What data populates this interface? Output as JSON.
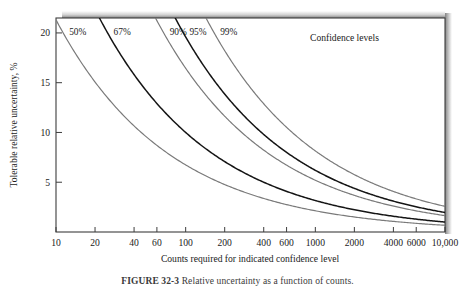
{
  "figure": {
    "caption_number": "FIGURE 32-3",
    "caption_text": "Relative uncertainty as a function of counts."
  },
  "chart_data": {
    "type": "line",
    "title": "",
    "xlabel": "Counts required for indicated confidence level",
    "ylabel": "Tolerable relative uncertainty, %",
    "legend_title": "Confidence levels",
    "legend_position": "top-right-inside",
    "xscale": "log",
    "yscale": "linear",
    "xlim": [
      10,
      10000
    ],
    "ylim": [
      0,
      21.5
    ],
    "grid": false,
    "xticks": [
      10,
      20,
      40,
      60,
      100,
      200,
      400,
      600,
      1000,
      2000,
      4000,
      6000,
      10000
    ],
    "xticklabels": [
      "10",
      "20",
      "40",
      "60",
      "100",
      "200",
      "400",
      "600",
      "1000",
      "2000",
      "4000",
      "6000",
      "10,000"
    ],
    "yticks": [
      5,
      10,
      15,
      20
    ],
    "yticklabels": [
      "5",
      "10",
      "15",
      "20"
    ],
    "relation": "y = k / sqrt(x)",
    "series": [
      {
        "name": "50%",
        "label": "50%",
        "color": "#7a7a7a",
        "k": 67.4,
        "x": [
          10,
          14,
          20,
          30,
          40,
          60,
          100,
          150,
          200,
          300,
          400,
          600,
          1000,
          1500,
          2000,
          3000,
          4000,
          6000,
          8000
        ],
        "values": [
          21.3,
          18.0,
          15.1,
          12.3,
          10.7,
          8.7,
          6.7,
          5.5,
          4.8,
          3.9,
          3.4,
          2.8,
          2.1,
          1.7,
          1.5,
          1.2,
          1.1,
          0.9,
          0.8
        ]
      },
      {
        "name": "67%",
        "label": "67%",
        "color": "#141414",
        "k": 100.0,
        "x": [
          25,
          30,
          40,
          60,
          100,
          150,
          200,
          300,
          400,
          600,
          1000,
          1500,
          2000,
          3000,
          4000,
          6000,
          8000
        ],
        "values": [
          20.0,
          18.3,
          15.8,
          12.9,
          10.0,
          8.2,
          7.1,
          5.8,
          5.0,
          4.1,
          3.2,
          2.6,
          2.2,
          1.8,
          1.6,
          1.3,
          1.1
        ]
      },
      {
        "name": "90%",
        "label": "90%",
        "color": "#7a7a7a",
        "k": 164.5,
        "x": [
          68,
          80,
          100,
          150,
          200,
          300,
          400,
          600,
          1000,
          1500,
          2000,
          3000,
          4000,
          6000,
          8000
        ],
        "values": [
          20.0,
          18.4,
          16.5,
          13.4,
          11.6,
          9.5,
          8.2,
          6.7,
          5.2,
          4.2,
          3.7,
          3.0,
          2.6,
          2.1,
          1.8
        ]
      },
      {
        "name": "95%",
        "label": "95%",
        "color": "#141414",
        "k": 196.0,
        "x": [
          96,
          120,
          150,
          200,
          300,
          400,
          600,
          1000,
          1500,
          2000,
          3000,
          4000,
          6000,
          8000
        ],
        "values": [
          20.0,
          17.9,
          16.0,
          13.9,
          11.3,
          9.8,
          8.0,
          6.2,
          5.1,
          4.4,
          3.6,
          3.1,
          2.5,
          2.2
        ]
      },
      {
        "name": "99%",
        "label": "99%",
        "color": "#7a7a7a",
        "k": 257.6,
        "x": [
          166,
          200,
          300,
          400,
          600,
          1000,
          1500,
          2000,
          3000,
          4000,
          6000,
          8000
        ],
        "values": [
          20.0,
          18.2,
          14.9,
          12.9,
          10.5,
          8.1,
          6.7,
          5.8,
          4.7,
          4.1,
          3.3,
          2.9
        ]
      }
    ]
  }
}
